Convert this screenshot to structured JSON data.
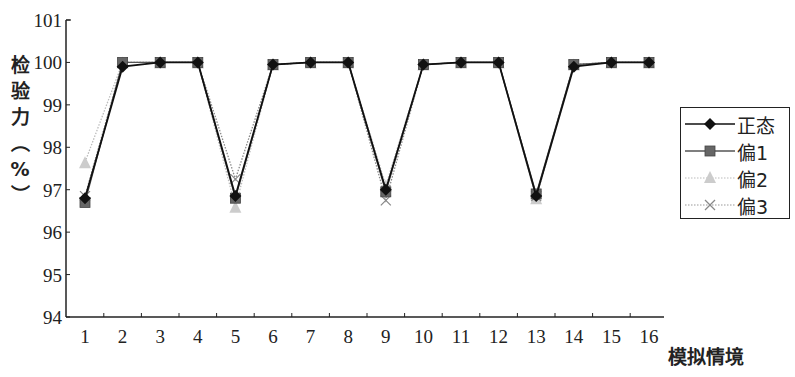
{
  "chart_data": {
    "type": "line",
    "title": "",
    "xlabel": "模拟情境",
    "ylabel": "检验力（%）",
    "ylim": [
      94,
      101
    ],
    "yticks": [
      94,
      95,
      96,
      97,
      98,
      99,
      100,
      101
    ],
    "categories": [
      "1",
      "2",
      "3",
      "4",
      "5",
      "6",
      "7",
      "8",
      "9",
      "10",
      "11",
      "12",
      "13",
      "14",
      "15",
      "16"
    ],
    "grid": false,
    "legend_position": "right",
    "series": [
      {
        "name": "正态",
        "marker": "diamond",
        "color": "#111111",
        "dash": "solid",
        "values": [
          96.8,
          99.9,
          100,
          100,
          96.85,
          99.95,
          100,
          100,
          97.0,
          99.95,
          100,
          100,
          96.85,
          99.9,
          100,
          100
        ]
      },
      {
        "name": "偏1",
        "marker": "square",
        "color": "#555555",
        "dash": "solid",
        "values": [
          96.7,
          100,
          100,
          100,
          96.8,
          99.95,
          100,
          100,
          96.95,
          99.95,
          100,
          100,
          96.9,
          99.95,
          100,
          100
        ]
      },
      {
        "name": "偏2",
        "marker": "triangle",
        "color": "#bbbbbb",
        "dash": "dotted",
        "values": [
          97.65,
          100,
          100,
          100,
          96.6,
          99.95,
          100,
          100,
          97.1,
          99.95,
          100,
          100,
          96.8,
          99.95,
          100,
          100
        ]
      },
      {
        "name": "偏3",
        "marker": "x",
        "color": "#888888",
        "dash": "dotted",
        "values": [
          96.85,
          100,
          100,
          100,
          97.25,
          99.95,
          100,
          100,
          96.75,
          99.95,
          100,
          100,
          96.85,
          99.95,
          100,
          100
        ]
      }
    ]
  },
  "labels": {
    "ylabel_chars": [
      "检",
      "验",
      "力",
      "︵",
      "%",
      "︶"
    ],
    "xlabel": "模拟情境"
  },
  "legend": [
    {
      "label": "正态"
    },
    {
      "label": "偏1"
    },
    {
      "label": "偏2"
    },
    {
      "label": "偏3"
    }
  ]
}
